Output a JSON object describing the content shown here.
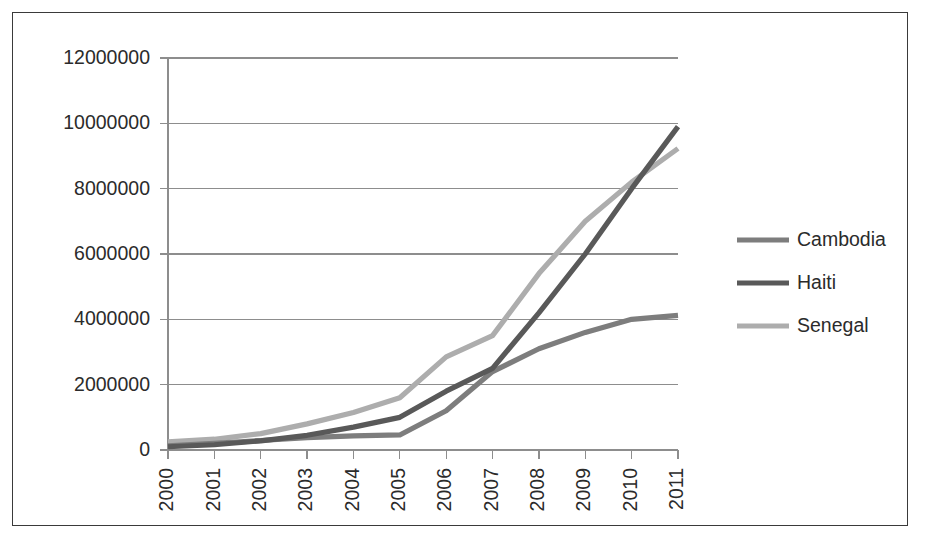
{
  "chart_data": {
    "type": "line",
    "title": "",
    "subtitle": "",
    "xlabel": "",
    "ylabel": "",
    "categories": [
      "2000",
      "2001",
      "2002",
      "2003",
      "2004",
      "2005",
      "2006",
      "2007",
      "2008",
      "2009",
      "2010",
      "2011"
    ],
    "x": [
      2000,
      2001,
      2002,
      2003,
      2004,
      2005,
      2006,
      2007,
      2008,
      2009,
      2010,
      2011
    ],
    "ylim": [
      0,
      12000000
    ],
    "xlim": [
      2000,
      2011
    ],
    "y_ticks": [
      0,
      2000000,
      4000000,
      6000000,
      8000000,
      10000000,
      12000000
    ],
    "y_tick_labels": [
      "0",
      "2000000",
      "4000000",
      "6000000",
      "8000000",
      "10000000",
      "12000000"
    ],
    "x_tick_labels": [
      "2000",
      "2001",
      "2002",
      "2003",
      "2004",
      "2005",
      "2006",
      "2007",
      "2008",
      "2009",
      "2010",
      "2011"
    ],
    "x_tick_rotation": 90,
    "grid": "horizontal",
    "legend_position": "right",
    "series": [
      {
        "name": "Cambodia",
        "color": "#7d7d7d",
        "values": [
          130000,
          200000,
          290000,
          380000,
          430000,
          460000,
          1200000,
          2400000,
          3100000,
          3600000,
          4000000,
          4120000
        ]
      },
      {
        "name": "Haiti",
        "color": "#595959",
        "values": [
          100000,
          160000,
          280000,
          450000,
          700000,
          1000000,
          1800000,
          2500000,
          4200000,
          6000000,
          8000000,
          9900000
        ]
      },
      {
        "name": "Senegal",
        "color": "#adadad",
        "values": [
          250000,
          330000,
          500000,
          800000,
          1150000,
          1600000,
          2850000,
          3500000,
          5400000,
          7000000,
          8200000,
          9230000
        ]
      }
    ]
  },
  "legend": {
    "items": [
      {
        "label": "Cambodia",
        "color": "#7d7d7d"
      },
      {
        "label": "Haiti",
        "color": "#595959"
      },
      {
        "label": "Senegal",
        "color": "#adadad"
      }
    ]
  },
  "colors": {
    "frame": "#3a3a3a",
    "axis": "#8d8d8d",
    "grid": "#8d8d8d",
    "text": "#2b2b2b",
    "background": "#ffffff"
  }
}
